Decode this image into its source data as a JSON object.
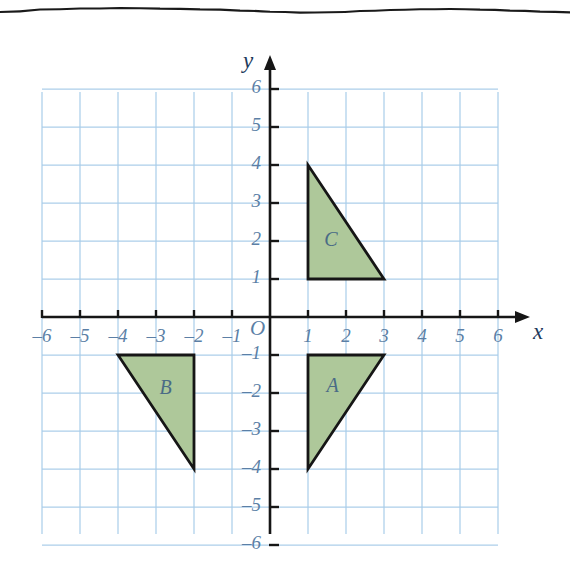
{
  "page": {
    "background": "#ffffff",
    "torn_edge": true
  },
  "chart_data": {
    "type": "scatter",
    "title": "",
    "subtitle": "",
    "xlabel": "x",
    "ylabel": "y",
    "xlim": [
      -6,
      6
    ],
    "ylim": [
      -6,
      6
    ],
    "grid": true,
    "grid_step": 1,
    "legend": "none",
    "x_ticks": [
      -6,
      -5,
      -4,
      -3,
      -2,
      -1,
      1,
      2,
      3,
      4,
      5,
      6
    ],
    "y_ticks": [
      6,
      5,
      4,
      3,
      2,
      1,
      -1,
      -2,
      -3,
      -4,
      -5,
      -6
    ],
    "x_tick_labels": [
      "–6",
      "–5",
      "–4",
      "–3",
      "–2",
      "–1",
      "1",
      "2",
      "3",
      "4",
      "5",
      "6"
    ],
    "y_tick_labels": [
      "6",
      "5",
      "4",
      "3",
      "2",
      "1",
      "–1",
      "–2",
      "–3",
      "–4",
      "–5",
      "–6"
    ],
    "origin_label": "O",
    "shapes": [
      {
        "name": "A",
        "label": "A",
        "type": "triangle",
        "vertices": [
          [
            1,
            -1
          ],
          [
            3,
            -1
          ],
          [
            1,
            -4
          ]
        ],
        "label_at": [
          1.65,
          -1.85
        ],
        "fill": "#aec89a",
        "stroke": "#161616"
      },
      {
        "name": "B",
        "label": "B",
        "type": "triangle",
        "vertices": [
          [
            -4,
            -1
          ],
          [
            -2,
            -1
          ],
          [
            -2,
            -4
          ]
        ],
        "label_at": [
          -2.75,
          -1.9
        ],
        "fill": "#aec89a",
        "stroke": "#161616"
      },
      {
        "name": "C",
        "label": "C",
        "type": "triangle",
        "vertices": [
          [
            1,
            4
          ],
          [
            1,
            1
          ],
          [
            3,
            1
          ]
        ],
        "label_at": [
          1.6,
          2.0
        ],
        "fill": "#aec89a",
        "stroke": "#161616"
      }
    ]
  },
  "colors": {
    "grid_line": "#a8cdea",
    "grid_line_soft": "#c9e0f3",
    "axis": "#161616",
    "tick_text": "#5b7fa6",
    "axis_name": "#1d3a5c",
    "shape_fill": "#aec89a",
    "shape_stroke": "#161616",
    "shape_label": "#4a6b86",
    "paper": "#ffffff",
    "torn_edge": "#1a1a1a"
  },
  "geometry": {
    "origin_px": [
      270,
      317
    ],
    "cell_px": 38,
    "grid_left_px": 42,
    "grid_right_px": 498,
    "grid_top_px": 92,
    "grid_bottom_px": 534
  }
}
